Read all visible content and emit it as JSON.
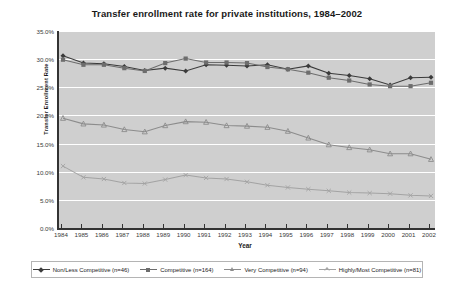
{
  "chart_data": {
    "type": "line",
    "title": "Transfer enrollment rate for private institutions, 1984–2002",
    "xlabel": "Year",
    "ylabel": "Transfer Enrollment Rate",
    "grid": true,
    "legend_position": "bottom",
    "plot_background": "#cfcfcf",
    "gridline_color": "#ffffff",
    "axis_color": "#333333",
    "ylim": [
      0,
      35
    ],
    "ytick_labels": [
      "35.0%",
      "30.0%",
      "25.0%",
      "20.0%",
      "15.0%",
      "10.0%",
      "5.0%",
      "0.0%"
    ],
    "ytick_values": [
      35,
      30,
      25,
      20,
      15,
      10,
      5,
      0
    ],
    "categories": [
      "1984",
      "1985",
      "1986",
      "1987",
      "1988",
      "1989",
      "1990",
      "1991",
      "1992",
      "1993",
      "1994",
      "1995",
      "1996",
      "1997",
      "1998",
      "1999",
      "2000",
      "2001",
      "2002"
    ],
    "x": [
      1984,
      1985,
      1986,
      1987,
      1988,
      1989,
      1990,
      1991,
      1992,
      1993,
      1994,
      1995,
      1996,
      1997,
      1998,
      1999,
      2000,
      2001,
      2002
    ],
    "series": [
      {
        "name": "Non/Less Competitive (n=46)",
        "color": "#3b3b3b",
        "marker": "diamond",
        "values": [
          30.6,
          29.3,
          29.2,
          28.7,
          28.0,
          28.4,
          27.9,
          29.0,
          28.9,
          28.8,
          29.0,
          28.2,
          28.8,
          27.5,
          27.1,
          26.5,
          25.4,
          26.7,
          26.8
        ]
      },
      {
        "name": "Competitive (n=164)",
        "color": "#6d6d6d",
        "marker": "square",
        "values": [
          29.9,
          29.0,
          29.0,
          28.4,
          27.9,
          29.3,
          30.1,
          29.4,
          29.4,
          29.3,
          28.6,
          28.2,
          27.6,
          26.7,
          26.2,
          25.5,
          25.2,
          25.2,
          25.8
        ]
      },
      {
        "name": "Very Competitive (n=94)",
        "color": "#8c8c8c",
        "marker": "triangle",
        "values": [
          19.5,
          18.5,
          18.3,
          17.5,
          17.1,
          18.2,
          18.9,
          18.8,
          18.2,
          18.1,
          17.9,
          17.2,
          16.0,
          14.8,
          14.3,
          13.9,
          13.2,
          13.2,
          12.2
        ]
      },
      {
        "name": "Highly/Most Competitive (n=81)",
        "color": "#a3a3a3",
        "marker": "cross",
        "values": [
          11.0,
          9.0,
          8.7,
          8.0,
          7.9,
          8.6,
          9.4,
          8.9,
          8.7,
          8.2,
          7.6,
          7.2,
          6.9,
          6.6,
          6.3,
          6.2,
          6.1,
          5.8,
          5.7
        ]
      }
    ]
  },
  "legend": {
    "items": [
      {
        "label": "Non/Less Competitive (n=46)"
      },
      {
        "label": "Competitive (n=164)"
      },
      {
        "label": "Very Competitive (n=94)"
      },
      {
        "label": "Highly/Most Competitive (n=81)"
      }
    ]
  }
}
